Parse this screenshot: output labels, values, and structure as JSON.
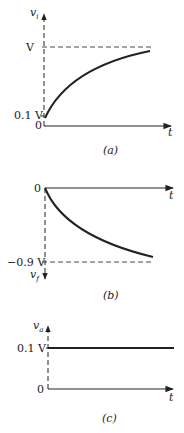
{
  "colors": {
    "ink": "#222222",
    "background": "#ffffff"
  },
  "panels": [
    {
      "caption": "(a)",
      "y_axis": {
        "symbol": "v",
        "subscript": "i",
        "direction": "up"
      },
      "x_axis": {
        "label": "t"
      },
      "ticks": [
        {
          "label": "V",
          "kind": "dashed-asymptote"
        },
        {
          "label": "0.1 V"
        },
        {
          "label": "0"
        }
      ],
      "curve": "rising concave curve from 0.1 V approaching V"
    },
    {
      "caption": "(b)",
      "y_axis": {
        "symbol": "v",
        "subscript": "f",
        "direction": "down"
      },
      "x_axis": {
        "label": "t"
      },
      "ticks": [
        {
          "label": "0"
        },
        {
          "label": "−0.9 V",
          "kind": "dashed-asymptote"
        }
      ],
      "curve": "falling curve from 0 approaching -0.9 V"
    },
    {
      "caption": "(c)",
      "y_axis": {
        "symbol": "v",
        "subscript": "a",
        "direction": "up"
      },
      "x_axis": {
        "label": "t"
      },
      "ticks": [
        {
          "label": "0.1 V"
        },
        {
          "label": "0"
        }
      ],
      "curve": "constant horizontal line at 0.1 V"
    }
  ]
}
